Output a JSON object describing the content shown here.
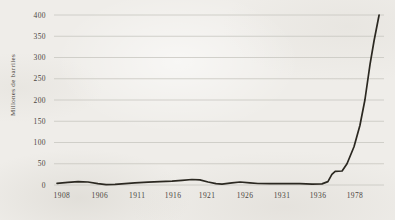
{
  "page": {
    "background_color": "#efede9",
    "text_color": "#4a453e"
  },
  "chart_data": {
    "type": "line",
    "title": "",
    "xlabel": "",
    "ylabel": "Millones de barriles",
    "ylim": [
      0,
      400
    ],
    "grid": "horizontal-only",
    "legend": "none",
    "line_color": "#2b2821",
    "grid_color": "#c8c6c0",
    "y_ticks": [
      0,
      50,
      100,
      150,
      200,
      250,
      300,
      350,
      400
    ],
    "x_ticks": [
      {
        "label": "1908",
        "f": 0.024
      },
      {
        "label": "1906",
        "f": 0.139
      },
      {
        "label": "1911",
        "f": 0.252
      },
      {
        "label": "1916",
        "f": 0.361
      },
      {
        "label": "1921",
        "f": 0.464
      },
      {
        "label": "1926",
        "f": 0.579
      },
      {
        "label": "1931",
        "f": 0.691
      },
      {
        "label": "1936",
        "f": 0.8
      },
      {
        "label": "1978",
        "f": 0.912
      }
    ],
    "series": [
      {
        "points": [
          [
            0.009,
            4
          ],
          [
            0.042,
            6
          ],
          [
            0.073,
            8
          ],
          [
            0.103,
            7
          ],
          [
            0.133,
            3
          ],
          [
            0.158,
            1
          ],
          [
            0.185,
            1.5
          ],
          [
            0.215,
            3
          ],
          [
            0.245,
            5
          ],
          [
            0.285,
            6.5
          ],
          [
            0.321,
            8
          ],
          [
            0.358,
            9
          ],
          [
            0.388,
            11
          ],
          [
            0.418,
            13
          ],
          [
            0.442,
            12
          ],
          [
            0.467,
            7
          ],
          [
            0.491,
            3
          ],
          [
            0.509,
            2
          ],
          [
            0.539,
            5
          ],
          [
            0.564,
            7
          ],
          [
            0.594,
            5
          ],
          [
            0.618,
            3.5
          ],
          [
            0.655,
            3
          ],
          [
            0.7,
            3
          ],
          [
            0.745,
            3
          ],
          [
            0.782,
            2
          ],
          [
            0.812,
            2.5
          ],
          [
            0.83,
            8
          ],
          [
            0.842,
            25
          ],
          [
            0.852,
            32
          ],
          [
            0.873,
            33
          ],
          [
            0.888,
            50
          ],
          [
            0.909,
            90
          ],
          [
            0.927,
            140
          ],
          [
            0.942,
            200
          ],
          [
            0.958,
            285
          ],
          [
            0.97,
            340
          ],
          [
            0.985,
            400
          ]
        ]
      }
    ]
  }
}
